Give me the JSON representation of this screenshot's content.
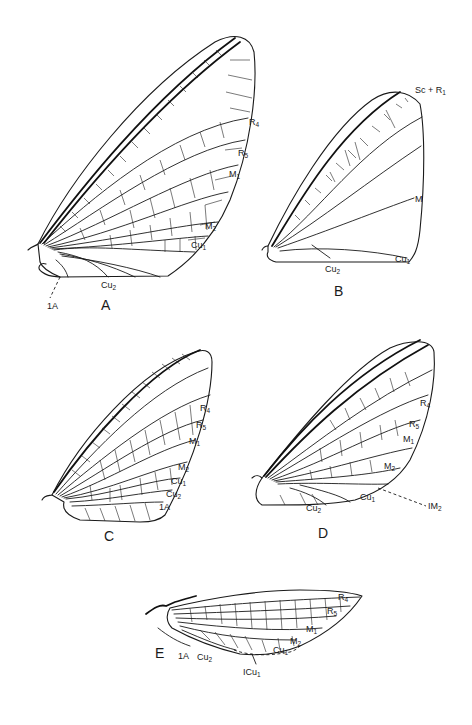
{
  "figure": {
    "panels": [
      {
        "id": "A",
        "letter": "A",
        "veins": [
          {
            "name": "R4",
            "base": "R",
            "sub": "4"
          },
          {
            "name": "R5",
            "base": "R",
            "sub": "5"
          },
          {
            "name": "M1",
            "base": "M",
            "sub": "1"
          },
          {
            "name": "M2",
            "base": "M",
            "sub": "2"
          },
          {
            "name": "Cu1",
            "base": "Cu",
            "sub": "1"
          },
          {
            "name": "Cu2",
            "base": "Cu",
            "sub": "2"
          },
          {
            "name": "1A",
            "base": "1A",
            "sub": ""
          }
        ]
      },
      {
        "id": "B",
        "letter": "B",
        "veins": [
          {
            "name": "Sc + R1",
            "base": "Sc + R",
            "sub": "1"
          },
          {
            "name": "M",
            "base": "M",
            "sub": ""
          },
          {
            "name": "Cu1",
            "base": "Cu",
            "sub": "1"
          },
          {
            "name": "Cu2",
            "base": "Cu",
            "sub": "2"
          }
        ]
      },
      {
        "id": "C",
        "letter": "C",
        "veins": [
          {
            "name": "R4",
            "base": "R",
            "sub": "4"
          },
          {
            "name": "R5",
            "base": "R",
            "sub": "5"
          },
          {
            "name": "M1",
            "base": "M",
            "sub": "1"
          },
          {
            "name": "M2",
            "base": "M",
            "sub": "2"
          },
          {
            "name": "Cu1",
            "base": "Cu",
            "sub": "1"
          },
          {
            "name": "Cu2",
            "base": "Cu",
            "sub": "2"
          },
          {
            "name": "1A",
            "base": "1A",
            "sub": ""
          }
        ]
      },
      {
        "id": "D",
        "letter": "D",
        "veins": [
          {
            "name": "R4",
            "base": "R",
            "sub": "4"
          },
          {
            "name": "R5",
            "base": "R",
            "sub": "5"
          },
          {
            "name": "M1",
            "base": "M",
            "sub": "1"
          },
          {
            "name": "M2",
            "base": "M",
            "sub": "2"
          },
          {
            "name": "IM2",
            "base": "IM",
            "sub": "2"
          },
          {
            "name": "Cu1",
            "base": "Cu",
            "sub": "1"
          },
          {
            "name": "Cu2",
            "base": "Cu",
            "sub": "2"
          }
        ]
      },
      {
        "id": "E",
        "letter": "E",
        "veins": [
          {
            "name": "R4",
            "base": "R",
            "sub": "4"
          },
          {
            "name": "R5",
            "base": "R",
            "sub": "5"
          },
          {
            "name": "M1",
            "base": "M",
            "sub": "1"
          },
          {
            "name": "M2",
            "base": "M",
            "sub": "2"
          },
          {
            "name": "Cu1",
            "base": "Cu",
            "sub": "1"
          },
          {
            "name": "Cu2",
            "base": "Cu",
            "sub": "2"
          },
          {
            "name": "1A",
            "base": "1A",
            "sub": ""
          },
          {
            "name": "ICu1",
            "base": "ICu",
            "sub": "1"
          }
        ]
      }
    ]
  }
}
